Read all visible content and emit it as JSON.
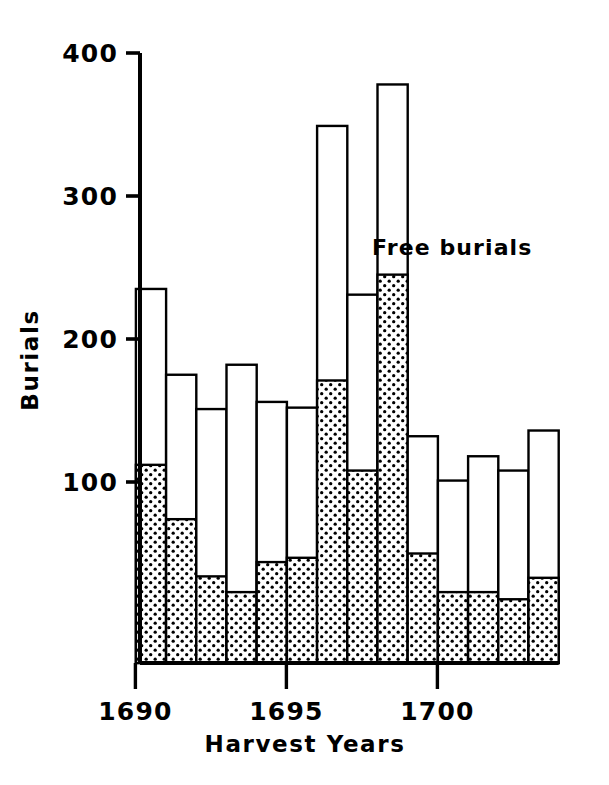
{
  "chart_data": {
    "type": "bar",
    "subtype": "stacked-bar",
    "title": "",
    "xlabel": "Harvest Years",
    "ylabel": "Burials",
    "ylim": [
      0,
      400
    ],
    "ytick_values": [
      100,
      200,
      300,
      400
    ],
    "ytick_labels": [
      "100",
      "200",
      "300",
      "400"
    ],
    "xlim": [
      1689.5,
      1703.5
    ],
    "xtick_values": [
      1690,
      1695,
      1700
    ],
    "xtick_labels": [
      "1690",
      "1695",
      "1700"
    ],
    "grid": false,
    "legend_position": "inline-annotation",
    "annotations": [
      {
        "text": "Free burials",
        "x": 1701.2,
        "y": 200
      }
    ],
    "categories": [
      1690,
      1691,
      1692,
      1693,
      1694,
      1695,
      1696,
      1697,
      1698,
      1699,
      1700,
      1701,
      1702,
      1703
    ],
    "series": [
      {
        "name": "Free burials",
        "style": "stippled",
        "values": [
          112,
          74,
          34,
          23,
          44,
          47,
          171,
          108,
          245,
          50,
          23,
          23,
          18,
          33
        ]
      },
      {
        "name": "Other burials",
        "style": "open",
        "values": [
          123,
          101,
          117,
          159,
          112,
          105,
          178,
          123,
          133,
          82,
          78,
          95,
          90,
          103
        ]
      }
    ],
    "totals": [
      235,
      175,
      151,
      182,
      156,
      152,
      349,
      231,
      378,
      132,
      101,
      118,
      108,
      136
    ]
  }
}
